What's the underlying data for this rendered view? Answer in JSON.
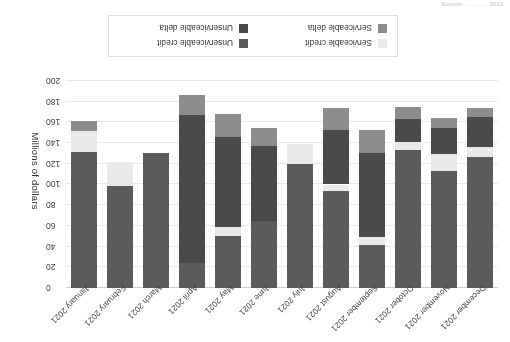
{
  "source_note": "Source: ... , ... , 2021",
  "chart_data": {
    "type": "bar",
    "subtype": "stacked-column",
    "title": "",
    "xlabel": "",
    "ylabel": "Millions of dollars",
    "ylim": [
      0,
      200
    ],
    "ytick_step": 20,
    "yticks": [
      "0",
      "20",
      "40",
      "60",
      "80",
      "100",
      "120",
      "140",
      "160",
      "180",
      "200"
    ],
    "grid": true,
    "orientation": "rotated-180",
    "legend_position": "bottom",
    "categories": [
      "December 2021",
      "November 2021",
      "October 2021",
      "September 2021",
      "August 2021",
      "July 2021",
      "June 2021",
      "May 2021",
      "April 2021",
      "March 2021",
      "February 2021",
      "January 2021"
    ],
    "series": [
      {
        "name": "Serviceable credit",
        "color": "#5b5b5b",
        "values": [
          127,
          113,
          133,
          42,
          94,
          120,
          65,
          50,
          24,
          130,
          99,
          131
        ]
      },
      {
        "name": "Serviceable delta",
        "color": "#e9e9e9",
        "values": [
          9,
          16,
          8,
          7,
          6,
          19,
          0,
          9,
          0,
          0,
          23,
          21
        ]
      },
      {
        "name": "Unserviceable credit",
        "color": "#4a4a4a",
        "values": [
          29,
          26,
          22,
          81,
          53,
          0,
          72,
          87,
          143,
          0,
          0,
          0
        ]
      },
      {
        "name": "Unserviceable delta",
        "color": "#8d8d8d",
        "values": [
          9,
          9,
          12,
          23,
          21,
          0,
          18,
          22,
          19,
          0,
          0,
          9
        ]
      }
    ]
  },
  "legend": {
    "items": [
      {
        "label": "Serviceable credit",
        "color": "#e9e9e9"
      },
      {
        "label": "Serviceable delta",
        "color": "#8d8d8d"
      },
      {
        "label": "Unserviceable credit",
        "color": "#5b5b5b"
      },
      {
        "label": "Unserviceable delta",
        "color": "#4a4a4a"
      }
    ]
  },
  "colors": {
    "grid": "#e8e8ec",
    "axis": "#d2d2d8",
    "text": "#333333",
    "background": "#ffffff"
  }
}
